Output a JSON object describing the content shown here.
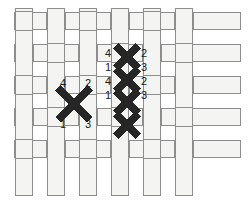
{
  "diagram": {
    "colors": {
      "background": "#ffffff",
      "strip_fill": "#f4f4f2",
      "strip_stroke": "#8d8d8d",
      "thread": "#262626",
      "label_text": "#1a1a1a"
    },
    "fabric": {
      "type": "plain-weave",
      "warp_columns": 6,
      "weft_rows": 5,
      "strip_thickness": 17,
      "pitch": 32
    },
    "single_stitch": {
      "name": "completed-cross-stitch",
      "center_x": 74,
      "center_y": 104,
      "labels": [
        {
          "text": "4",
          "corner": "top-left",
          "x": 60,
          "y": 78
        },
        {
          "text": "2",
          "corner": "top-right",
          "x": 85,
          "y": 78
        },
        {
          "text": "1",
          "corner": "bottom-left",
          "x": 60,
          "y": 119
        },
        {
          "text": "3",
          "corner": "bottom-right",
          "x": 85,
          "y": 119
        }
      ]
    },
    "stitch_column": {
      "name": "vertical-row-of-cross-stitches",
      "count": 4,
      "center_x": 127,
      "top_y": 46,
      "bottom_y": 136,
      "left_labels": [
        {
          "text": "4",
          "x": 105,
          "y": 48
        },
        {
          "text": "1",
          "x": 105,
          "y": 62
        },
        {
          "text": "4",
          "x": 105,
          "y": 76
        },
        {
          "text": "1",
          "x": 105,
          "y": 90
        }
      ],
      "right_labels": [
        {
          "text": "2",
          "x": 141,
          "y": 48
        },
        {
          "text": "3",
          "x": 141,
          "y": 62
        },
        {
          "text": "2",
          "x": 141,
          "y": 76
        },
        {
          "text": "3",
          "x": 141,
          "y": 90
        }
      ]
    }
  }
}
